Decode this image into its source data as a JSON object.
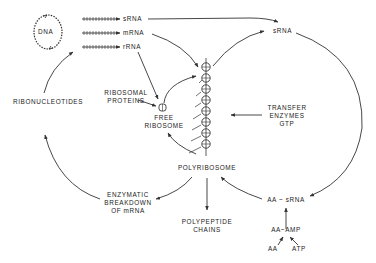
{
  "diagram": {
    "type": "biochemical cycle diagram (RNA and protein synthesis)",
    "colors": {
      "line": "#333333",
      "text": "#222222",
      "background": "#ffffff"
    },
    "nodes": {
      "dna": "DNA",
      "srna_top": "sRNA",
      "mrna": "mRNA",
      "rrna": "rRNA",
      "srna_right": "sRNA",
      "ribosomal_proteins": [
        "RIBOSOMAL",
        "PROTEINS"
      ],
      "free_ribosome": [
        "FREE",
        "RIBOSOME"
      ],
      "transfer_enzymes": [
        "TRANSFER",
        "ENZYMES",
        "GTP"
      ],
      "ribonucleotides": "RIBONUCLEOTIDES",
      "polyribosome": "POLYRIBOSOME",
      "enzymatic_breakdown": [
        "ENZYMATIC",
        "BREAKDOWN",
        "OF mRNA"
      ],
      "polypeptide_chains": [
        "POLYPEPTIDE",
        "CHAINS"
      ],
      "aa_srna": "AA ~ sRNA",
      "aa_amp": "AA~AMP",
      "aa": "AA",
      "atp": "ATP"
    },
    "edges": [
      {
        "from": "DNA",
        "to": "sRNA",
        "style": "transcription-hatched"
      },
      {
        "from": "DNA",
        "to": "mRNA",
        "style": "transcription-hatched"
      },
      {
        "from": "DNA",
        "to": "rRNA",
        "style": "transcription-hatched"
      },
      {
        "from": "sRNA (top)",
        "to": "sRNA (right)"
      },
      {
        "from": "mRNA",
        "to": "polyribosome"
      },
      {
        "from": "rRNA",
        "to": "free ribosome"
      },
      {
        "from": "ribosomal proteins",
        "to": "free ribosome"
      },
      {
        "from": "free ribosome",
        "to": "polyribosome"
      },
      {
        "from": "polyribosome",
        "to": "sRNA (right)"
      },
      {
        "from": "transfer enzymes GTP",
        "to": "polyribosome"
      },
      {
        "from": "polyribosome",
        "to": "free ribosome"
      },
      {
        "from": "polyribosome",
        "to": "polypeptide chains"
      },
      {
        "from": "polyribosome",
        "to": "enzymatic breakdown of mRNA"
      },
      {
        "from": "enzymatic breakdown of mRNA",
        "to": "ribonucleotides"
      },
      {
        "from": "ribonucleotides",
        "to": "DNA transcription"
      },
      {
        "from": "sRNA (right)",
        "to": "AA ~ sRNA"
      },
      {
        "from": "AA ~ sRNA",
        "to": "polyribosome"
      },
      {
        "from": "AA~AMP",
        "to": "AA ~ sRNA"
      },
      {
        "from": "AA",
        "to": "AA~AMP"
      },
      {
        "from": "ATP",
        "to": "AA~AMP"
      }
    ]
  }
}
